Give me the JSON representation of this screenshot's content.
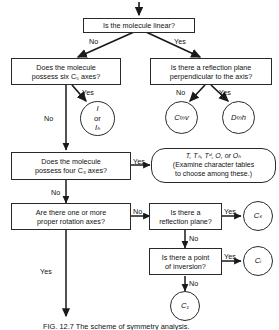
{
  "figure": {
    "caption": "FIG. 12.7   The scheme of symmetry analysis."
  },
  "nodes": {
    "q_linear": "Is the molecule linear?",
    "q_c5_line1": "Does the molecule",
    "q_c5_line2": "possess six C₅ axes?",
    "q_reflection_perp_line1": "Is there a reflection plane",
    "q_reflection_perp_line2": "perpendicular to the axis?",
    "q_c3_line1": "Does the molecule",
    "q_c3_line2": "possess four C₃ axes?",
    "q_proper_rot_line1": "Are there one or more",
    "q_proper_rot_line2": "proper rotation axes?",
    "q_reflection_plane_line1": "Is there a",
    "q_reflection_plane_line2": "reflection plane?",
    "q_inversion_line1": "Is there a point",
    "q_inversion_line2": "of inversion?",
    "tetra_octa_line1": "T, Tₕ, Tᵈ, O, or Oₕ",
    "tetra_octa_line2": "(Examine character tables",
    "tetra_octa_line3": "to choose among these.)"
  },
  "terminals": {
    "icosahedral_line1": "I",
    "icosahedral_line2": "or",
    "icosahedral_line3": "Iₕ",
    "c_inf_v": "C∞v",
    "d_inf_h": "D∞h",
    "cs": "Cₛ",
    "ci": "Cᵢ",
    "c1": "C₁"
  },
  "edge_labels": {
    "linear_no": "No",
    "linear_yes": "Yes",
    "c5_yes": "Yes",
    "c5_no": "No",
    "perp_no": "No",
    "perp_yes": "Yes",
    "c3_yes": "Yes",
    "c3_no": "No",
    "proper_no": "No",
    "proper_yes": "Yes",
    "plane_yes": "Yes",
    "plane_no": "No",
    "inversion_yes": "Yes",
    "inversion_no": "No"
  },
  "colors": {
    "stroke": "#2a2a2a",
    "text": "#111111",
    "background": "#ffffff"
  }
}
